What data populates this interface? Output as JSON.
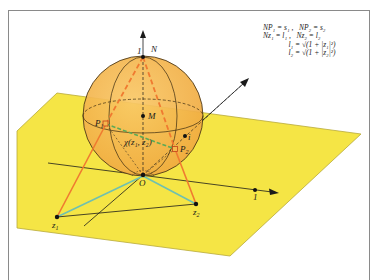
{
  "figure": {
    "colors": {
      "plane": "#F5E545",
      "plane_edge": "#B8A93A",
      "sphere": "#F6B84E",
      "sphere_edge": "#3a2a10",
      "projection_lines": "#F07A30",
      "distance_lines": "#6FC0B0",
      "chordal_line": "#5DAA55",
      "frame": "#8a8a8a"
    },
    "labels": {
      "north_pole": "N",
      "north_tick": "1",
      "center": "M",
      "origin": "O",
      "imag_unit": "i",
      "real_unit": "1",
      "p1": "P",
      "p1_sub": "1",
      "p2": "P",
      "p2_sub": "2",
      "z1": "z",
      "z1_sub": "1",
      "z2": "z",
      "z2_sub": "2",
      "chordal": "χ(z₁, z₂)"
    },
    "formulas": {
      "line1_a": "NP₁ = s₁ ,",
      "line1_b": "NP₂ = s₂",
      "line2_a": "Nz₁ = l₁ ,",
      "line2_b": "Nz₂ = l₂",
      "line3": "l₁ = √(1 + |z₁|²)",
      "line4": "l₂ = √(1 + |z₂|²)"
    }
  }
}
